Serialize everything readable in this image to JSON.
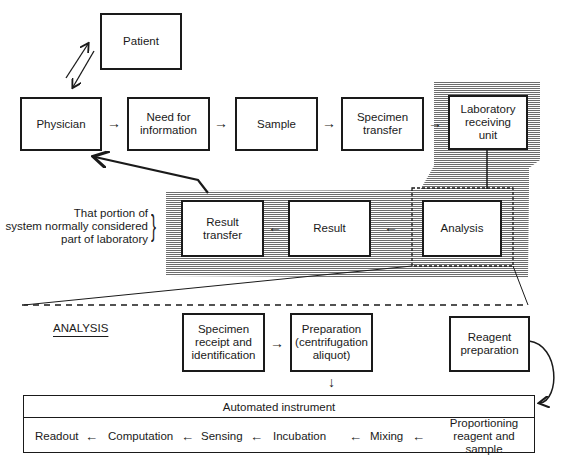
{
  "diagram": {
    "top_flow": {
      "patient": "Patient",
      "physician": "Physician",
      "need_for_information": "Need for\ninformation",
      "sample": "Sample",
      "specimen_transfer": "Specimen\ntransfer",
      "laboratory_receiving_unit": "Laboratory\nreceiving\nunit"
    },
    "lab_flow": {
      "result_transfer": "Result\ntransfer",
      "result": "Result",
      "analysis": "Analysis"
    },
    "bracket_note": {
      "line1": "That portion of",
      "line2": "system normally considered",
      "line3": "part of laboratory",
      "bracket": "}"
    },
    "arrows": {
      "right": "→",
      "left": "←",
      "down": "↓"
    },
    "analysis_section": {
      "title": "ANALYSIS",
      "specimen_receipt": "Specimen\nreceipt and\nidentification",
      "preparation": "Preparation\n(centrifugation\naliquot)",
      "reagent_preparation": "Reagent\npreparation"
    },
    "instrument": {
      "title": "Automated instrument",
      "steps": [
        "Readout",
        "Computation",
        "Sensing",
        "Incubation",
        "Mixing",
        "Proportioning\nreagent and sample"
      ]
    }
  }
}
